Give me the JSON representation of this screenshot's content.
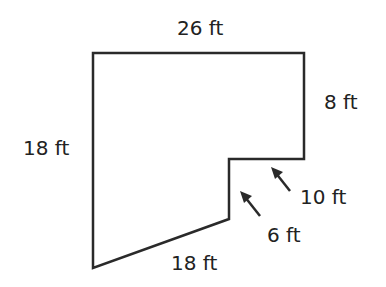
{
  "diagram": {
    "type": "composite-polygon-floor-plan",
    "stroke_color": "#2a2a2a",
    "labels": {
      "top": "26 ft",
      "right": "8 ft",
      "left": "18 ft",
      "inner_horizontal": "10 ft",
      "inner_vertical": "6 ft",
      "bottom_slant": "18 ft"
    }
  }
}
